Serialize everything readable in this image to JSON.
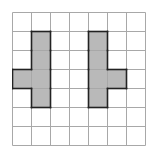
{
  "figure": {
    "label": ")",
    "grid": {
      "cols": 7,
      "rows": 7,
      "cell_px": 19,
      "line_color": "#a8a8a8"
    },
    "shape_fill": "#b9b9b9",
    "shape_stroke": "#222222",
    "shapes": [
      {
        "name": "left-shape",
        "cells": [
          [
            1,
            1
          ],
          [
            1,
            2
          ],
          [
            0,
            3
          ],
          [
            1,
            3
          ],
          [
            1,
            4
          ]
        ]
      },
      {
        "name": "right-shape",
        "cells": [
          [
            4,
            1
          ],
          [
            4,
            2
          ],
          [
            4,
            3
          ],
          [
            5,
            3
          ],
          [
            4,
            4
          ]
        ]
      }
    ]
  }
}
